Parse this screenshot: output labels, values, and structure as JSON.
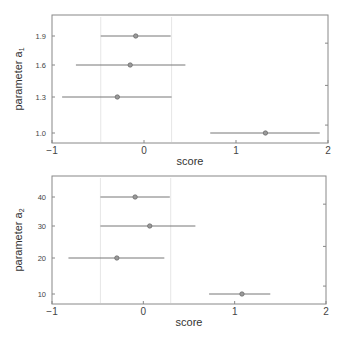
{
  "chart_data": [
    {
      "type": "errorbar",
      "title": "",
      "xlabel": "score",
      "ylabel": "parameter a",
      "ylabel_subscript": "1",
      "xlim": [
        -1,
        2
      ],
      "xticks": [
        "-1",
        "0",
        "1",
        "2"
      ],
      "yticks": [
        "1.0",
        "1.3",
        "1.6",
        "1.9"
      ],
      "reference_lines_x": [
        -0.47,
        0.3
      ],
      "grid": false,
      "points": [
        {
          "y_label": "1.9",
          "center": -0.09,
          "low": -0.47,
          "high": 0.29
        },
        {
          "y_label": "1.6",
          "center": -0.15,
          "low": -0.74,
          "high": 0.45
        },
        {
          "y_label": "1.3",
          "center": -0.29,
          "low": -0.89,
          "high": 0.3
        },
        {
          "y_label": "1.0",
          "center": 1.32,
          "low": 0.72,
          "high": 1.91
        }
      ]
    },
    {
      "type": "errorbar",
      "title": "",
      "xlabel": "score",
      "ylabel": "parameter a",
      "ylabel_subscript": "2",
      "xlim": [
        -1,
        2
      ],
      "xticks": [
        "-1",
        "0",
        "1",
        "2"
      ],
      "yticks": [
        "10",
        "20",
        "30",
        "40"
      ],
      "reference_lines_x": [
        -0.47,
        0.3
      ],
      "grid": false,
      "points": [
        {
          "y_label": "40",
          "center": -0.09,
          "low": -0.47,
          "high": 0.29
        },
        {
          "y_label": "30",
          "center": 0.07,
          "low": -0.47,
          "high": 0.57
        },
        {
          "y_label": "20",
          "center": -0.29,
          "low": -0.82,
          "high": 0.23
        },
        {
          "y_label": "10",
          "center": 1.08,
          "low": 0.72,
          "high": 1.39
        }
      ]
    }
  ],
  "colors": {
    "axis": "#888888",
    "bar": "#777777",
    "marker_fill": "#9a9a9a",
    "marker_stroke": "#666666",
    "ref_line": "#e6e6e6"
  }
}
